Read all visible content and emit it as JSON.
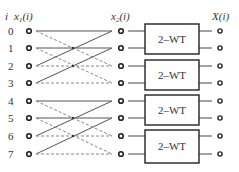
{
  "headers": {
    "index": "i",
    "input": "x",
    "input_sub": "1",
    "input_arg": "(i)",
    "middle": "x",
    "middle_sub": "2",
    "middle_arg": "(i)",
    "output": "X(i)"
  },
  "rows": [
    "0",
    "1",
    "2",
    "3",
    "4",
    "5",
    "6",
    "7"
  ],
  "blocks": [
    {
      "label": "2–WT"
    },
    {
      "label": "2–WT"
    },
    {
      "label": "2–WT"
    },
    {
      "label": "2–WT"
    }
  ],
  "colors": {
    "line": "#555555",
    "dashed": "#888888",
    "box": "#222222"
  }
}
